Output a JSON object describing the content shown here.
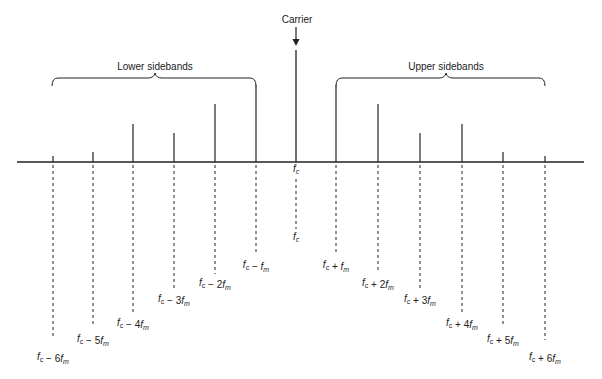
{
  "diagram": {
    "carrier_label": "Carrier",
    "lower_group_label": "Lower sidebands",
    "upper_group_label": "Upper sidebands",
    "carrier_tick_label": "f_c",
    "colors": {
      "ink": "#222222",
      "background": "#ffffff"
    },
    "baseline": {
      "x1": 17,
      "x2": 584,
      "y": 162
    },
    "carrier": {
      "x": 296,
      "top": 50,
      "arrow_top": 27,
      "arrow_bottom": 45,
      "label": "f_c",
      "label_y": 240
    },
    "lines": [
      {
        "name": "fc-6fm",
        "x": 53,
        "top": 156,
        "dash_end": 338,
        "label": "f_c − 6f_m",
        "label_y": 360
      },
      {
        "name": "fc-5fm",
        "x": 93,
        "top": 152,
        "dash_end": 326,
        "label": "f_c − 5f_m",
        "label_y": 342
      },
      {
        "name": "fc-4fm",
        "x": 133,
        "top": 124,
        "dash_end": 312,
        "label": "f_c − 4f_m",
        "label_y": 326
      },
      {
        "name": "fc-3fm",
        "x": 174,
        "top": 133,
        "dash_end": 288,
        "label": "f_c − 3f_m",
        "label_y": 302
      },
      {
        "name": "fc-2fm",
        "x": 215,
        "top": 104,
        "dash_end": 274,
        "label": "f_c − 2f_m",
        "label_y": 286
      },
      {
        "name": "fc-fm",
        "x": 256,
        "top": 85,
        "dash_end": 255,
        "label": "f_c − f_m",
        "label_y": 268
      },
      {
        "name": "fc+fm",
        "x": 336,
        "top": 85,
        "dash_end": 255,
        "label": "f_c + f_m",
        "label_y": 268
      },
      {
        "name": "fc+2fm",
        "x": 378,
        "top": 104,
        "dash_end": 273,
        "label": "f_c + 2f_m",
        "label_y": 286
      },
      {
        "name": "fc+3fm",
        "x": 420,
        "top": 133,
        "dash_end": 288,
        "label": "f_c + 3f_m",
        "label_y": 302
      },
      {
        "name": "fc+4fm",
        "x": 462,
        "top": 124,
        "dash_end": 312,
        "label": "f_c + 4f_m",
        "label_y": 326
      },
      {
        "name": "fc+5fm",
        "x": 503,
        "top": 152,
        "dash_end": 326,
        "label": "f_c + 5f_m",
        "label_y": 342
      },
      {
        "name": "fc+6fm",
        "x": 545,
        "top": 156,
        "dash_end": 340,
        "label": "f_c + 6f_m",
        "label_y": 360
      }
    ]
  }
}
